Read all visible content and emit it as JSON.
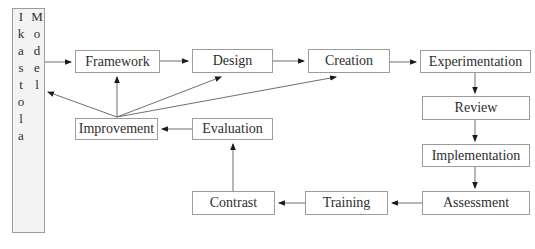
{
  "diagram": {
    "side_label": "Ikastola Model",
    "nodes": {
      "framework": "Framework",
      "design": "Design",
      "creation": "Creation",
      "experimentation": "Experimentation",
      "review": "Review",
      "implementation": "Implementation",
      "assessment": "Assessment",
      "training": "Training",
      "contrast": "Contrast",
      "evaluation": "Evaluation",
      "improvement": "Improvement"
    },
    "edges": [
      {
        "from": "Ikastola Model",
        "to": "Framework"
      },
      {
        "from": "Framework",
        "to": "Design"
      },
      {
        "from": "Design",
        "to": "Creation"
      },
      {
        "from": "Creation",
        "to": "Experimentation"
      },
      {
        "from": "Experimentation",
        "to": "Review"
      },
      {
        "from": "Review",
        "to": "Implementation"
      },
      {
        "from": "Implementation",
        "to": "Assessment"
      },
      {
        "from": "Assessment",
        "to": "Training"
      },
      {
        "from": "Training",
        "to": "Contrast"
      },
      {
        "from": "Contrast",
        "to": "Evaluation"
      },
      {
        "from": "Evaluation",
        "to": "Improvement"
      },
      {
        "from": "Improvement",
        "to": "Framework"
      },
      {
        "from": "Improvement",
        "to": "Ikastola Model"
      },
      {
        "from": "Improvement",
        "to": "Design"
      },
      {
        "from": "Improvement",
        "to": "Creation"
      }
    ],
    "colors": {
      "background": "#ffffff",
      "box_fill": "#ffffff",
      "side_box_fill": "#f3f3f3",
      "box_border": "#9c9c9c",
      "line": "#6f6f6f",
      "arrowhead": "#1a1a1a",
      "text": "#2e2e2e"
    }
  }
}
